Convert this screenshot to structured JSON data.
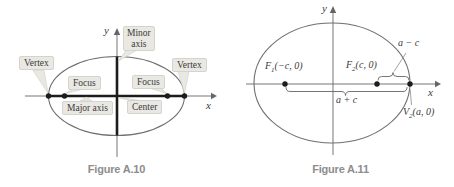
{
  "fig10": {
    "caption": "Figure A.10",
    "y_axis_label": "y",
    "x_axis_label": "x",
    "callouts": {
      "vertex_left": "Vertex",
      "focus_left": "Focus",
      "minor_axis_line1": "Minor",
      "minor_axis_line2": "axis",
      "vertex_right": "Vertex",
      "focus_right": "Focus",
      "major_axis": "Major axis",
      "center": "Center"
    }
  },
  "fig11": {
    "caption": "Figure A.11",
    "y_axis_label": "y",
    "x_axis_label": "x",
    "points": {
      "f1": {
        "letter": "F",
        "sub": "1",
        "coords": "(−c, 0)"
      },
      "f2": {
        "letter": "F",
        "sub": "2",
        "coords": "(c, 0)"
      },
      "v2": {
        "letter": "V",
        "sub": "2",
        "coords": "(a, 0)"
      }
    },
    "measures": {
      "a_minus_c": "a − c",
      "a_plus_c": "a + c"
    }
  },
  "colors": {
    "axis": "#666666",
    "curve": "#6f6f6f",
    "bold_axis": "#1c1c1c",
    "dot": "#1c1c1c",
    "callout_bg": "#eae8e3",
    "callout_border": "#d5d3cd",
    "text": "#3a3a3a",
    "caption": "#8d8d8d",
    "leader": "#8a8a8a"
  }
}
